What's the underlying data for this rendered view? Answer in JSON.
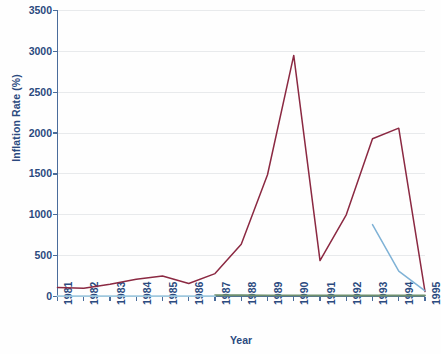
{
  "chart_data": {
    "type": "line",
    "title": "",
    "xlabel": "Year",
    "ylabel": "Inflation Rate (%)",
    "x": [
      1981,
      1982,
      1983,
      1984,
      1985,
      1986,
      1987,
      1988,
      1989,
      1990,
      1991,
      1992,
      1993,
      1994,
      1995
    ],
    "xtick_labels": [
      "1981",
      "1982",
      "1983",
      "1984",
      "1985",
      "1986",
      "1987",
      "1988",
      "1989",
      "1990",
      "1991",
      "1992",
      "1993",
      "1994",
      "1995"
    ],
    "ytick_labels": [
      "0",
      "500",
      "1000",
      "1500",
      "2000",
      "2500",
      "3000",
      "3500"
    ],
    "yticks": [
      0,
      500,
      1000,
      1500,
      2000,
      2500,
      3000,
      3500
    ],
    "ylim": [
      0,
      3500
    ],
    "xlim": [
      1981,
      1995
    ],
    "grid": true,
    "grid_axis": "y",
    "legend": "none",
    "series": [
      {
        "name": "series-maroon",
        "color": "#8b2942",
        "x": [
          1981,
          1982,
          1983,
          1984,
          1985,
          1986,
          1987,
          1988,
          1989,
          1990,
          1991,
          1992,
          1993,
          1994,
          1995
        ],
        "values": [
          110,
          100,
          150,
          210,
          250,
          160,
          280,
          640,
          1490,
          2950,
          440,
          1000,
          1930,
          2060,
          60
        ]
      },
      {
        "name": "series-blue",
        "color": "#7fb2d6",
        "x": [
          1993,
          1994,
          1995
        ],
        "values": [
          880,
          310,
          70
        ]
      },
      {
        "name": "series-green",
        "color": "#6e8f6e",
        "x": [
          1987,
          1988,
          1989,
          1990,
          1991,
          1992,
          1993,
          1994,
          1995
        ],
        "values": [
          15,
          15,
          14,
          14,
          13,
          13,
          12,
          12,
          12
        ]
      },
      {
        "name": "series-lightblue-baseline",
        "color": "#9fc8de",
        "x": [
          1981,
          1982,
          1983,
          1984,
          1985,
          1986,
          1987
        ],
        "values": [
          4,
          4,
          4,
          4,
          4,
          4,
          4
        ]
      }
    ]
  },
  "axis": {
    "axis_color": "#4a6c9b",
    "grid_color": "#e8eaec",
    "tick_text_color": "#2b4a7e"
  }
}
